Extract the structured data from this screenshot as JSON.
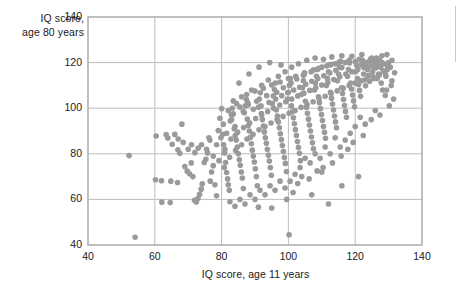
{
  "chart_data": {
    "type": "scatter",
    "title": "",
    "xlabel": "IQ score, age 11 years",
    "ylabel_line1": "IQ score,",
    "ylabel_line2": "age 80 years",
    "xlim": [
      40,
      140
    ],
    "ylim": [
      40,
      140
    ],
    "xticks": [
      40,
      60,
      80,
      100,
      120,
      140
    ],
    "yticks": [
      40,
      60,
      80,
      100,
      120,
      140
    ],
    "grid": true,
    "legend": "none",
    "marker": {
      "shape": "circle",
      "color": "#9a9a9a",
      "size_px": 5.6,
      "opacity": 1
    },
    "frame_color": "#b0b0b0",
    "grid_color": "#bdbdbd",
    "n_points": 404,
    "points": [
      [
        52.3,
        79.2
      ],
      [
        54.1,
        43.4
      ],
      [
        60.2,
        68.6
      ],
      [
        62.1,
        58.8
      ],
      [
        64.6,
        58.6
      ],
      [
        62.0,
        68.2
      ],
      [
        64.8,
        68.0
      ],
      [
        66.8,
        67.4
      ],
      [
        60.4,
        87.8
      ],
      [
        63.4,
        88.4
      ],
      [
        63.9,
        86.9
      ],
      [
        65.2,
        84.2
      ],
      [
        66.9,
        81.8
      ],
      [
        67.5,
        80.2
      ],
      [
        68.1,
        93.0
      ],
      [
        69.0,
        74.4
      ],
      [
        69.7,
        72.4
      ],
      [
        70.4,
        71.2
      ],
      [
        70.9,
        76.0
      ],
      [
        71.4,
        70.0
      ],
      [
        71.9,
        59.6
      ],
      [
        72.4,
        58.9
      ],
      [
        72.9,
        60.4
      ],
      [
        73.4,
        62.2
      ],
      [
        73.9,
        64.5
      ],
      [
        74.2,
        66.8
      ],
      [
        74.8,
        76.2
      ],
      [
        75.3,
        77.6
      ],
      [
        75.8,
        80.4
      ],
      [
        76.2,
        87.0
      ],
      [
        76.6,
        68.0
      ],
      [
        77.0,
        72.0
      ],
      [
        77.5,
        74.8
      ],
      [
        78.0,
        66.4
      ],
      [
        78.5,
        61.6
      ],
      [
        79.0,
        90.2
      ],
      [
        79.5,
        95.6
      ],
      [
        80.0,
        99.8
      ],
      [
        80.3,
        88.6
      ],
      [
        80.6,
        84.0
      ],
      [
        80.9,
        80.4
      ],
      [
        81.2,
        76.2
      ],
      [
        81.5,
        71.8
      ],
      [
        81.8,
        69.0
      ],
      [
        82.0,
        66.4
      ],
      [
        82.3,
        64.0
      ],
      [
        82.6,
        94.4
      ],
      [
        82.9,
        97.2
      ],
      [
        83.2,
        100.0
      ],
      [
        83.5,
        103.2
      ],
      [
        83.8,
        91.0
      ],
      [
        84.1,
        88.0
      ],
      [
        84.4,
        86.0
      ],
      [
        84.7,
        83.0
      ],
      [
        85.0,
        80.0
      ],
      [
        85.3,
        77.4
      ],
      [
        85.6,
        75.0
      ],
      [
        85.9,
        72.0
      ],
      [
        86.2,
        69.4
      ],
      [
        86.5,
        64.8
      ],
      [
        86.8,
        98.0
      ],
      [
        87.1,
        101.0
      ],
      [
        87.4,
        103.8
      ],
      [
        87.7,
        95.2
      ],
      [
        88.0,
        92.4
      ],
      [
        88.3,
        90.0
      ],
      [
        88.6,
        87.2
      ],
      [
        88.9,
        84.4
      ],
      [
        89.2,
        81.6
      ],
      [
        89.5,
        79.0
      ],
      [
        89.8,
        76.4
      ],
      [
        90.1,
        73.4
      ],
      [
        90.4,
        70.0
      ],
      [
        90.7,
        66.0
      ],
      [
        91.0,
        100.4
      ],
      [
        91.3,
        104.0
      ],
      [
        91.6,
        106.8
      ],
      [
        91.9,
        97.6
      ],
      [
        92.2,
        95.0
      ],
      [
        92.5,
        92.2
      ],
      [
        92.8,
        89.6
      ],
      [
        93.1,
        87.0
      ],
      [
        93.4,
        84.6
      ],
      [
        93.7,
        82.0
      ],
      [
        94.0,
        79.4
      ],
      [
        94.3,
        76.8
      ],
      [
        94.6,
        74.0
      ],
      [
        94.9,
        70.6
      ],
      [
        95.2,
        102.0
      ],
      [
        95.5,
        105.4
      ],
      [
        95.8,
        108.2
      ],
      [
        96.1,
        111.0
      ],
      [
        96.4,
        99.2
      ],
      [
        96.7,
        96.6
      ],
      [
        97.0,
        94.0
      ],
      [
        97.3,
        91.4
      ],
      [
        97.6,
        88.8
      ],
      [
        97.9,
        86.2
      ],
      [
        98.2,
        83.6
      ],
      [
        98.5,
        81.0
      ],
      [
        98.8,
        78.4
      ],
      [
        99.1,
        75.8
      ],
      [
        99.4,
        72.2
      ],
      [
        99.7,
        104.0
      ],
      [
        100.0,
        107.0
      ],
      [
        100.3,
        110.0
      ],
      [
        100.6,
        113.0
      ],
      [
        100.9,
        101.0
      ],
      [
        101.2,
        98.4
      ],
      [
        101.5,
        95.8
      ],
      [
        101.8,
        93.2
      ],
      [
        102.1,
        90.6
      ],
      [
        102.4,
        88.0
      ],
      [
        102.7,
        85.4
      ],
      [
        103.0,
        82.8
      ],
      [
        103.3,
        80.2
      ],
      [
        103.6,
        77.0
      ],
      [
        103.9,
        106.0
      ],
      [
        104.2,
        109.0
      ],
      [
        104.5,
        112.0
      ],
      [
        104.8,
        115.0
      ],
      [
        105.1,
        103.0
      ],
      [
        105.4,
        100.4
      ],
      [
        105.7,
        97.8
      ],
      [
        106.0,
        95.2
      ],
      [
        106.3,
        92.6
      ],
      [
        106.6,
        90.0
      ],
      [
        106.9,
        87.4
      ],
      [
        107.2,
        84.8
      ],
      [
        107.5,
        82.2
      ],
      [
        107.8,
        108.0
      ],
      [
        108.1,
        111.0
      ],
      [
        108.4,
        114.0
      ],
      [
        108.7,
        117.0
      ],
      [
        109.0,
        105.0
      ],
      [
        109.3,
        102.4
      ],
      [
        109.6,
        99.8
      ],
      [
        109.9,
        97.2
      ],
      [
        110.2,
        94.6
      ],
      [
        110.5,
        92.0
      ],
      [
        110.8,
        89.4
      ],
      [
        111.1,
        86.8
      ],
      [
        111.4,
        110.0
      ],
      [
        111.7,
        113.0
      ],
      [
        112.0,
        116.0
      ],
      [
        112.3,
        119.0
      ],
      [
        112.6,
        107.0
      ],
      [
        112.9,
        104.4
      ],
      [
        113.2,
        101.8
      ],
      [
        113.5,
        99.2
      ],
      [
        113.8,
        96.6
      ],
      [
        114.1,
        94.0
      ],
      [
        114.4,
        91.4
      ],
      [
        114.7,
        112.0
      ],
      [
        115.0,
        115.0
      ],
      [
        115.3,
        118.0
      ],
      [
        115.6,
        120.6
      ],
      [
        115.9,
        109.0
      ],
      [
        116.2,
        106.4
      ],
      [
        116.5,
        103.8
      ],
      [
        116.8,
        101.2
      ],
      [
        117.1,
        98.6
      ],
      [
        117.4,
        96.0
      ],
      [
        117.7,
        114.0
      ],
      [
        118.0,
        117.0
      ],
      [
        118.3,
        119.8
      ],
      [
        118.6,
        111.0
      ],
      [
        118.9,
        108.4
      ],
      [
        119.2,
        105.8
      ],
      [
        119.5,
        103.2
      ],
      [
        119.8,
        100.6
      ],
      [
        120.1,
        116.0
      ],
      [
        120.4,
        118.8
      ],
      [
        120.7,
        113.0
      ],
      [
        121.0,
        110.4
      ],
      [
        121.3,
        107.8
      ],
      [
        121.6,
        105.2
      ],
      [
        121.9,
        119.0
      ],
      [
        122.2,
        121.0
      ],
      [
        122.5,
        115.0
      ],
      [
        122.8,
        112.4
      ],
      [
        123.1,
        109.8
      ],
      [
        123.4,
        120.0
      ],
      [
        123.7,
        117.0
      ],
      [
        124.0,
        114.4
      ],
      [
        124.3,
        111.8
      ],
      [
        124.6,
        121.6
      ],
      [
        124.9,
        118.4
      ],
      [
        125.2,
        116.0
      ],
      [
        125.5,
        113.0
      ],
      [
        125.8,
        120.2
      ],
      [
        126.1,
        117.6
      ],
      [
        126.4,
        122.0
      ],
      [
        126.7,
        119.0
      ],
      [
        127.0,
        115.0
      ],
      [
        127.3,
        121.0
      ],
      [
        127.6,
        118.0
      ],
      [
        128.0,
        120.0
      ],
      [
        128.4,
        116.4
      ],
      [
        128.8,
        119.4
      ],
      [
        129.2,
        114.0
      ],
      [
        129.6,
        117.0
      ],
      [
        130.0,
        120.0
      ],
      [
        130.5,
        118.0
      ],
      [
        131.0,
        112.0
      ],
      [
        131.5,
        104.0
      ],
      [
        130.2,
        101.0
      ],
      [
        129.0,
        105.6
      ],
      [
        128.2,
        108.0
      ],
      [
        127.4,
        97.0
      ],
      [
        126.0,
        99.0
      ],
      [
        124.8,
        95.0
      ],
      [
        123.0,
        93.0
      ],
      [
        121.5,
        96.0
      ],
      [
        120.0,
        92.0
      ],
      [
        118.5,
        89.0
      ],
      [
        117.0,
        86.0
      ],
      [
        115.5,
        83.0
      ],
      [
        114.0,
        87.0
      ],
      [
        112.5,
        80.0
      ],
      [
        111.0,
        83.0
      ],
      [
        109.5,
        78.0
      ],
      [
        108.0,
        80.0
      ],
      [
        106.5,
        76.0
      ],
      [
        105.0,
        78.0
      ],
      [
        103.5,
        74.0
      ],
      [
        102.0,
        71.0
      ],
      [
        100.5,
        68.0
      ],
      [
        99.0,
        65.0
      ],
      [
        97.5,
        68.0
      ],
      [
        96.0,
        64.0
      ],
      [
        94.5,
        66.0
      ],
      [
        93.0,
        62.0
      ],
      [
        91.5,
        64.0
      ],
      [
        90.0,
        60.0
      ],
      [
        88.5,
        62.0
      ],
      [
        87.0,
        58.0
      ],
      [
        85.5,
        60.0
      ],
      [
        84.0,
        57.0
      ],
      [
        82.5,
        59.0
      ],
      [
        100.2,
        44.5
      ],
      [
        107.0,
        62.0
      ],
      [
        91.0,
        56.6
      ],
      [
        95.0,
        56.2
      ],
      [
        112.0,
        58.0
      ],
      [
        116.0,
        66.0
      ],
      [
        121.0,
        70.0
      ],
      [
        110.0,
        72.0
      ],
      [
        104.0,
        70.0
      ],
      [
        99.5,
        60.0
      ],
      [
        84.5,
        102.0
      ],
      [
        86.0,
        105.0
      ],
      [
        89.0,
        108.0
      ],
      [
        92.0,
        110.0
      ],
      [
        94.0,
        112.4
      ],
      [
        97.0,
        114.0
      ],
      [
        99.0,
        116.0
      ],
      [
        101.0,
        118.0
      ],
      [
        103.0,
        119.5
      ],
      [
        105.5,
        121.0
      ],
      [
        108.0,
        122.0
      ],
      [
        110.5,
        121.5
      ],
      [
        113.0,
        122.5
      ],
      [
        116.0,
        123.0
      ],
      [
        119.0,
        122.8
      ],
      [
        122.0,
        123.5
      ],
      [
        125.0,
        122.0
      ],
      [
        128.0,
        123.0
      ],
      [
        131.0,
        121.0
      ],
      [
        129.5,
        123.5
      ],
      [
        82.0,
        99.0
      ],
      [
        83.0,
        95.0
      ],
      [
        84.0,
        92.0
      ],
      [
        86.5,
        98.5
      ],
      [
        88.0,
        101.5
      ],
      [
        90.5,
        103.0
      ],
      [
        93.5,
        105.5
      ],
      [
        96.5,
        107.0
      ],
      [
        98.5,
        109.0
      ],
      [
        100.8,
        111.0
      ],
      [
        102.5,
        112.8
      ],
      [
        104.5,
        114.5
      ],
      [
        106.8,
        116.0
      ],
      [
        109.0,
        117.5
      ],
      [
        111.5,
        118.5
      ],
      [
        114.0,
        119.5
      ],
      [
        117.0,
        120.0
      ],
      [
        120.0,
        120.5
      ],
      [
        123.0,
        119.0
      ],
      [
        126.0,
        118.0
      ],
      [
        87.5,
        106.0
      ],
      [
        90.0,
        107.5
      ],
      [
        92.5,
        108.8
      ],
      [
        95.0,
        110.2
      ],
      [
        97.5,
        111.5
      ],
      [
        100.0,
        113.0
      ],
      [
        102.2,
        114.0
      ],
      [
        104.8,
        115.5
      ],
      [
        107.5,
        116.8
      ],
      [
        110.0,
        118.0
      ],
      [
        112.8,
        119.2
      ],
      [
        115.2,
        120.2
      ],
      [
        118.2,
        121.0
      ],
      [
        121.2,
        121.5
      ],
      [
        124.2,
        120.5
      ],
      [
        80.5,
        93.0
      ],
      [
        81.5,
        89.0
      ],
      [
        83.5,
        97.5
      ],
      [
        85.5,
        100.5
      ],
      [
        87.8,
        102.5
      ],
      [
        89.5,
        99.5
      ],
      [
        91.8,
        101.0
      ],
      [
        94.2,
        102.5
      ],
      [
        96.2,
        104.0
      ],
      [
        98.0,
        105.5
      ],
      [
        99.8,
        106.8
      ],
      [
        101.6,
        108.0
      ],
      [
        103.4,
        109.2
      ],
      [
        105.2,
        110.5
      ],
      [
        107.0,
        111.8
      ],
      [
        108.8,
        113.0
      ],
      [
        110.6,
        114.2
      ],
      [
        112.4,
        115.4
      ],
      [
        114.2,
        116.6
      ],
      [
        116.0,
        117.8
      ],
      [
        78.5,
        84.0
      ],
      [
        79.8,
        87.0
      ],
      [
        81.0,
        82.0
      ],
      [
        82.8,
        86.5
      ],
      [
        84.8,
        89.5
      ],
      [
        86.6,
        91.5
      ],
      [
        88.4,
        93.5
      ],
      [
        90.2,
        95.5
      ],
      [
        92.0,
        97.0
      ],
      [
        93.8,
        98.5
      ],
      [
        95.6,
        100.0
      ],
      [
        97.4,
        101.4
      ],
      [
        99.2,
        102.8
      ],
      [
        101.0,
        104.0
      ],
      [
        102.8,
        105.4
      ],
      [
        104.6,
        106.6
      ],
      [
        106.4,
        107.8
      ],
      [
        108.2,
        109.0
      ],
      [
        110.0,
        110.2
      ],
      [
        111.8,
        111.4
      ],
      [
        113.6,
        112.6
      ],
      [
        115.4,
        113.8
      ],
      [
        117.2,
        115.0
      ],
      [
        119.0,
        116.0
      ],
      [
        120.8,
        117.0
      ],
      [
        122.6,
        117.8
      ],
      [
        124.4,
        118.6
      ],
      [
        126.2,
        119.2
      ],
      [
        128.0,
        119.8
      ],
      [
        129.8,
        118.0
      ],
      [
        77.5,
        79.0
      ],
      [
        79.2,
        77.0
      ],
      [
        80.8,
        74.0
      ],
      [
        82.4,
        78.5
      ],
      [
        84.2,
        81.5
      ],
      [
        86.0,
        84.0
      ],
      [
        87.6,
        86.5
      ],
      [
        89.4,
        88.5
      ],
      [
        91.2,
        90.5
      ],
      [
        93.0,
        92.0
      ],
      [
        94.8,
        93.5
      ],
      [
        96.6,
        95.0
      ],
      [
        98.4,
        96.4
      ],
      [
        100.2,
        97.8
      ],
      [
        102.0,
        99.0
      ],
      [
        103.8,
        100.4
      ],
      [
        105.6,
        101.6
      ],
      [
        107.4,
        102.8
      ],
      [
        109.2,
        104.0
      ],
      [
        111.0,
        105.2
      ],
      [
        112.8,
        106.4
      ],
      [
        114.6,
        107.6
      ],
      [
        116.4,
        108.8
      ],
      [
        118.2,
        110.0
      ],
      [
        120.0,
        111.0
      ],
      [
        121.8,
        112.0
      ],
      [
        123.6,
        113.0
      ],
      [
        125.4,
        113.8
      ],
      [
        127.2,
        114.6
      ],
      [
        129.0,
        115.2
      ],
      [
        74.0,
        84.0
      ],
      [
        75.5,
        82.0
      ],
      [
        76.5,
        86.0
      ],
      [
        73.0,
        82.5
      ],
      [
        72.0,
        80.5
      ],
      [
        71.0,
        84.0
      ],
      [
        70.0,
        82.0
      ],
      [
        68.5,
        85.0
      ],
      [
        67.0,
        86.5
      ],
      [
        66.0,
        88.5
      ],
      [
        94.4,
        120.0
      ],
      [
        97.8,
        119.0
      ],
      [
        91.2,
        118.0
      ],
      [
        88.2,
        115.0
      ],
      [
        85.2,
        111.0
      ],
      [
        131.8,
        115.5
      ],
      [
        130.8,
        110.0
      ],
      [
        129.4,
        108.0
      ],
      [
        127.8,
        111.0
      ],
      [
        126.6,
        113.0
      ],
      [
        117.8,
        82.0
      ],
      [
        119.4,
        85.0
      ],
      [
        122.4,
        88.0
      ],
      [
        115.8,
        79.0
      ],
      [
        113.2,
        76.0
      ],
      [
        110.4,
        74.0
      ],
      [
        108.6,
        72.5
      ],
      [
        106.2,
        69.0
      ],
      [
        102.8,
        67.0
      ],
      [
        101.4,
        63.0
      ]
    ]
  }
}
